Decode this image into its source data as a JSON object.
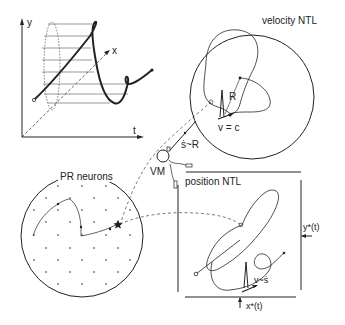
{
  "trajectory_plot": {
    "axis_y": "y",
    "axis_x": "x",
    "axis_t": "t"
  },
  "velocity_ntl": {
    "title": "velocity NTL",
    "radius_label": "R",
    "velocity_label": "v = c"
  },
  "connection": {
    "relation_label": "ṡ~R",
    "vm_label": "VM"
  },
  "pr_neurons": {
    "title": "PR neurons"
  },
  "position_ntl": {
    "title": "position NTL",
    "y_input_label": "y*(t)",
    "x_input_label": "x*(t)",
    "velocity_label": "v~ṡ"
  },
  "colors": {
    "ink": "#222222",
    "background": "#ffffff",
    "hatch": "#555555"
  }
}
